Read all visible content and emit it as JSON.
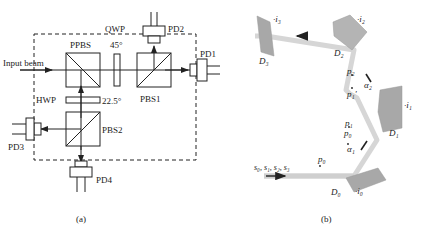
{
  "figure_a": {
    "caption": "(a)",
    "labels": {
      "input_beam": "Input beam",
      "ppbs": "PPBS",
      "qwp": "QWP",
      "qwp_angle": "45°",
      "pbs1": "PBS1",
      "pbs2": "PBS2",
      "hwp": "HWP",
      "hwp_angle": "22.5°",
      "pd1": "PD1",
      "pd2": "PD2",
      "pd3": "PD3",
      "pd4": "PD4"
    }
  },
  "figure_b": {
    "caption": "(b)",
    "labels": {
      "s_list": "s₀, s₁, s₂, s₃",
      "p0_a": "p₀",
      "p0_b": "p₀",
      "p1": "p₁",
      "p1_prime": "p₁′",
      "p2": "p₂",
      "alpha1": "α₁",
      "alpha2": "α₂",
      "d0": "D₀",
      "d1": "D₁",
      "d2": "D₂",
      "d3": "D₃",
      "i0": "·i₀",
      "i1": "·i₁",
      "i2": "·i₂",
      "i3": "·i₃"
    }
  },
  "colors": {
    "line": "#222222",
    "beam": "#d6d6d6",
    "mirror": "#a8a8a8"
  }
}
